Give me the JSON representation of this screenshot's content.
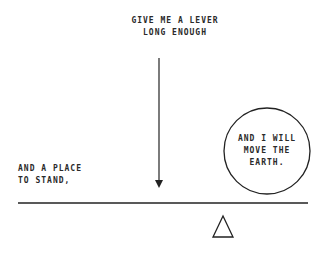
{
  "diagram": {
    "captions": {
      "top_line1": "GIVE ME A LEVER",
      "top_line2": "LONG ENOUGH",
      "left_line1": "AND A PLACE",
      "left_line2": "TO STAND,",
      "earth_line1": "AND I WILL",
      "earth_line2": "MOVE THE",
      "earth_line3": "EARTH."
    },
    "elements": {
      "force_arrow": "down-arrow",
      "lever": "horizontal-beam",
      "fulcrum": "triangle",
      "earth": "circle"
    },
    "colors": {
      "stroke": "#2a2a2a",
      "background": "#ffffff"
    }
  }
}
